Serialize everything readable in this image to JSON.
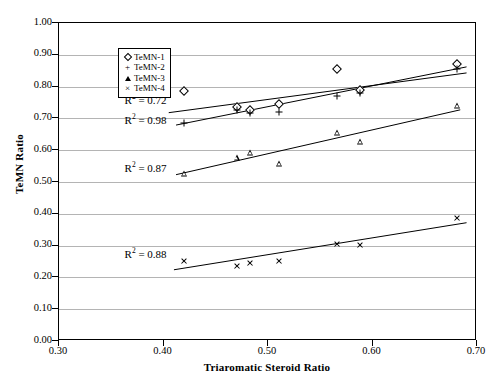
{
  "chart_data": {
    "type": "scatter",
    "title": "",
    "xlabel": "Triaromatic Steroid Ratio",
    "ylabel": "TeMN Ratio",
    "xlim": [
      0.3,
      0.7
    ],
    "ylim": [
      0.0,
      1.0
    ],
    "xticks": [
      "0.30",
      "0.40",
      "0.50",
      "0.60",
      "0.70"
    ],
    "xtick_values": [
      0.3,
      0.4,
      0.5,
      0.6,
      0.7
    ],
    "yticks": [
      "0.00",
      "0.10",
      "0.20",
      "0.30",
      "0.40",
      "0.50",
      "0.60",
      "0.70",
      "0.80",
      "0.90",
      "1.00"
    ],
    "ytick_values": [
      0.0,
      0.1,
      0.2,
      0.3,
      0.4,
      0.5,
      0.6,
      0.7,
      0.8,
      0.9,
      1.0
    ],
    "grid": "horizontal",
    "legend_position": "top-left-inside",
    "series": [
      {
        "name": "TeMN-1",
        "marker": "diamond",
        "r_squared_label": "R² = 0.72",
        "r_squared": 0.72,
        "points": [
          {
            "x": 0.42,
            "y": 0.785
          },
          {
            "x": 0.47,
            "y": 0.735
          },
          {
            "x": 0.483,
            "y": 0.726
          },
          {
            "x": 0.511,
            "y": 0.746
          },
          {
            "x": 0.566,
            "y": 0.855
          },
          {
            "x": 0.588,
            "y": 0.79
          },
          {
            "x": 0.681,
            "y": 0.87
          }
        ],
        "trend": {
          "x1": 0.405,
          "y1": 0.718,
          "x2": 0.69,
          "y2": 0.843
        }
      },
      {
        "name": "TeMN-2",
        "marker": "plus",
        "r_squared_label": "R² = 0.98",
        "r_squared": 0.98,
        "points": [
          {
            "x": 0.42,
            "y": 0.686
          },
          {
            "x": 0.47,
            "y": 0.726
          },
          {
            "x": 0.483,
            "y": 0.718
          },
          {
            "x": 0.511,
            "y": 0.719
          },
          {
            "x": 0.566,
            "y": 0.772
          },
          {
            "x": 0.588,
            "y": 0.779
          },
          {
            "x": 0.681,
            "y": 0.855
          }
        ],
        "trend": {
          "x1": 0.412,
          "y1": 0.679,
          "x2": 0.69,
          "y2": 0.862
        }
      },
      {
        "name": "TeMN-3",
        "marker": "triangle",
        "r_squared_label": "R² = 0.87",
        "r_squared": 0.87,
        "points": [
          {
            "x": 0.42,
            "y": 0.525
          },
          {
            "x": 0.47,
            "y": 0.574
          },
          {
            "x": 0.483,
            "y": 0.59
          },
          {
            "x": 0.511,
            "y": 0.556
          },
          {
            "x": 0.566,
            "y": 0.655
          },
          {
            "x": 0.588,
            "y": 0.626
          },
          {
            "x": 0.681,
            "y": 0.74
          }
        ],
        "trend": {
          "x1": 0.412,
          "y1": 0.523,
          "x2": 0.684,
          "y2": 0.727
        }
      },
      {
        "name": "TeMN-4",
        "marker": "x",
        "r_squared_label": "R² = 0.88",
        "r_squared": 0.88,
        "points": [
          {
            "x": 0.42,
            "y": 0.251
          },
          {
            "x": 0.47,
            "y": 0.236
          },
          {
            "x": 0.483,
            "y": 0.246
          },
          {
            "x": 0.511,
            "y": 0.251
          },
          {
            "x": 0.566,
            "y": 0.306
          },
          {
            "x": 0.588,
            "y": 0.301
          },
          {
            "x": 0.681,
            "y": 0.386
          }
        ],
        "trend": {
          "x1": 0.41,
          "y1": 0.224,
          "x2": 0.69,
          "y2": 0.372
        }
      }
    ],
    "annotations": [
      {
        "text": "R² = 0.72",
        "x": 0.403,
        "y": 0.758
      },
      {
        "text": "R² = 0.98",
        "x": 0.403,
        "y": 0.695
      },
      {
        "text": "R² = 0.87",
        "x": 0.403,
        "y": 0.545
      },
      {
        "text": "R² = 0.88",
        "x": 0.403,
        "y": 0.273
      }
    ]
  },
  "legend": {
    "items": [
      {
        "label": "TeMN-1",
        "marker": "diamond"
      },
      {
        "label": "TeMN-2",
        "marker": "plus"
      },
      {
        "label": "TeMN-3",
        "marker": "triangle"
      },
      {
        "label": "TeMN-4",
        "marker": "x"
      }
    ]
  },
  "colors": {
    "axis": "#000000",
    "grid": "#b4b4b4",
    "marker": "#000000",
    "background": "#ffffff"
  }
}
